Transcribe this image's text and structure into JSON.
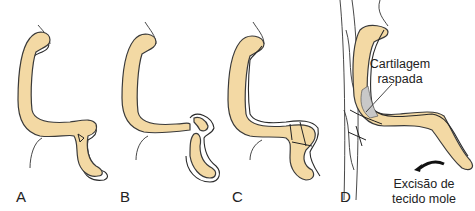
{
  "figure": {
    "panels": [
      {
        "id": "A",
        "label": "A"
      },
      {
        "id": "B",
        "label": "B"
      },
      {
        "id": "C",
        "label": "C"
      },
      {
        "id": "D",
        "label": "D"
      }
    ],
    "annotations": {
      "cartilage": {
        "line1": "Cartilagem",
        "line2": "raspada"
      },
      "excision": {
        "line1": "Excisão de",
        "line2": "tecido mole"
      }
    },
    "colors": {
      "cartilage_fill": "#f3d9a4",
      "scraped_fill": "#c8c8c8",
      "outline": "#2a2a2a"
    }
  }
}
